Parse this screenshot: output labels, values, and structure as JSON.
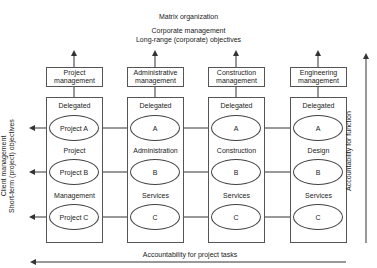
{
  "header": {
    "title": "Matrix organization",
    "subtitle_line1": "Corporate management",
    "subtitle_line2": "Long-range (corporate) objectives"
  },
  "columns": [
    {
      "mgmt_line1": "Project",
      "mgmt_line2": "management",
      "delegated": "Delegated",
      "ovals": [
        "Project A",
        "Project B",
        "Project C"
      ],
      "labels": [
        "Project",
        "Management"
      ]
    },
    {
      "mgmt_line1": "Administrative",
      "mgmt_line2": "management",
      "delegated": "Delegated",
      "ovals": [
        "A",
        "B",
        "C"
      ],
      "labels": [
        "Administration",
        "Services"
      ]
    },
    {
      "mgmt_line1": "Construction",
      "mgmt_line2": "management",
      "delegated": "Delegated",
      "ovals": [
        "A",
        "B",
        "C"
      ],
      "labels": [
        "Construction",
        "Services"
      ]
    },
    {
      "mgmt_line1": "Engineering",
      "mgmt_line2": "management",
      "delegated": "Delegated",
      "ovals": [
        "A",
        "B",
        "C"
      ],
      "labels": [
        "Design",
        "Services"
      ]
    }
  ],
  "left_axis": {
    "line1": "Client management",
    "line2": "Short-term (project) objectives"
  },
  "right_axis": {
    "label": "Accountability for function"
  },
  "bottom_axis": {
    "label": "Accountability for project tasks"
  },
  "colors": {
    "line": "#333333",
    "box_border": "#555555",
    "background": "#ffffff"
  }
}
